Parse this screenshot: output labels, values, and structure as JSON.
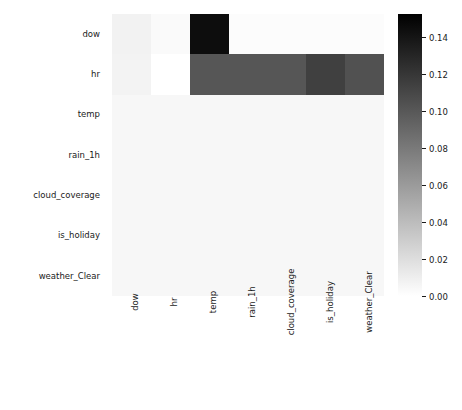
{
  "chart_data": {
    "type": "heatmap",
    "title": "",
    "xlabel": "",
    "ylabel": "",
    "grid": false,
    "legend_position": "right",
    "colormap": "Greys",
    "colorbar": {
      "label": "",
      "vmin": 0.0,
      "vmax": 0.1525,
      "ticks": [
        0.14,
        0.12,
        0.1,
        0.08,
        0.06,
        0.04,
        0.02,
        0.0
      ],
      "tick_labels": [
        "0.14",
        "0.12",
        "0.10",
        "0.08",
        "0.06",
        "0.04",
        "0.02",
        "0.00"
      ],
      "low_color": "#ffffff",
      "high_color": "#000000"
    },
    "x_categories": [
      "dow",
      "hr",
      "temp",
      "rain_1h",
      "cloud_coverage",
      "is_holiday",
      "weather_Clear"
    ],
    "y_categories": [
      "dow",
      "hr",
      "temp",
      "rain_1h",
      "cloud_coverage",
      "is_holiday",
      "weather_Clear"
    ],
    "values": [
      [
        0.008,
        0.003,
        0.145,
        0.002,
        0.002,
        0.002,
        0.002
      ],
      [
        0.007,
        0.0,
        0.101,
        0.101,
        0.101,
        0.114,
        0.104
      ],
      [
        0.005,
        0.005,
        0.005,
        0.005,
        0.005,
        0.005,
        0.005
      ],
      [
        0.005,
        0.005,
        0.005,
        0.005,
        0.005,
        0.005,
        0.005
      ],
      [
        0.005,
        0.005,
        0.005,
        0.005,
        0.005,
        0.005,
        0.005
      ],
      [
        0.005,
        0.005,
        0.005,
        0.005,
        0.005,
        0.005,
        0.005
      ],
      [
        0.005,
        0.005,
        0.005,
        0.005,
        0.005,
        0.005,
        0.005
      ]
    ]
  }
}
